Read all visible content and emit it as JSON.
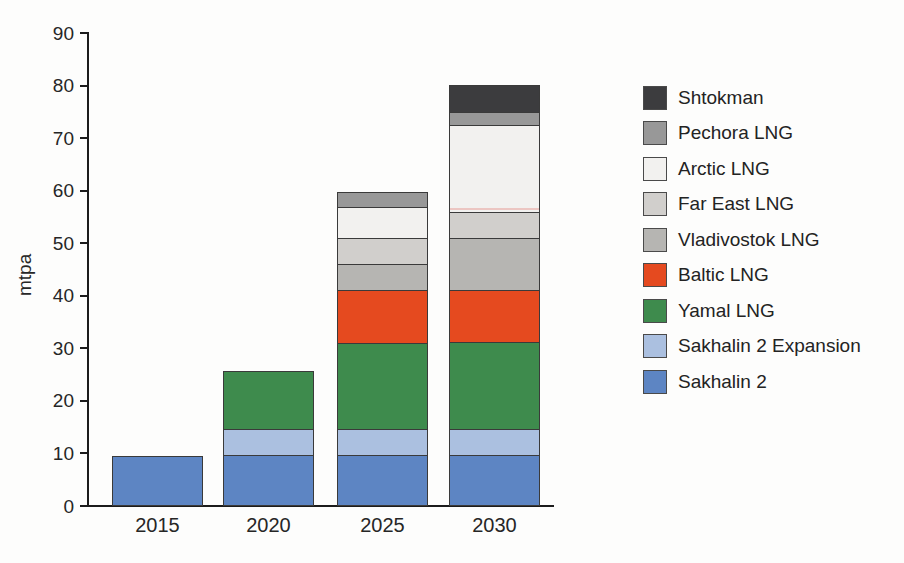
{
  "chart_data": {
    "type": "bar",
    "stacked": true,
    "title": "",
    "xlabel": "",
    "ylabel": "mtpa",
    "ylim": [
      0,
      90
    ],
    "yticks": [
      0,
      10,
      20,
      30,
      40,
      50,
      60,
      70,
      80,
      90
    ],
    "grid": false,
    "legend_position": "right",
    "categories": [
      "2015",
      "2020",
      "2025",
      "2030"
    ],
    "series": [
      {
        "name": "Sakhalin 2",
        "color": "#5d85c3",
        "values": [
          9.6,
          9.6,
          9.6,
          9.6
        ]
      },
      {
        "name": "Sakhalin 2 Expansion",
        "color": "#abc0e0",
        "values": [
          0,
          5,
          5,
          5
        ]
      },
      {
        "name": "Yamal LNG",
        "color": "#3e8b4d",
        "values": [
          0,
          11,
          16.5,
          16.5
        ]
      },
      {
        "name": "Baltic LNG",
        "color": "#e54a1f",
        "values": [
          0,
          0,
          10,
          10
        ]
      },
      {
        "name": "Vladivostok LNG",
        "color": "#b6b5b2",
        "values": [
          0,
          0,
          5,
          10
        ]
      },
      {
        "name": "Far East LNG",
        "color": "#d1cfcc",
        "values": [
          0,
          0,
          5,
          5
        ]
      },
      {
        "name": "Arctic LNG",
        "color": "#f2f1ef",
        "values": [
          0,
          0,
          6,
          16.5
        ]
      },
      {
        "name": "Pechora LNG",
        "color": "#989898",
        "values": [
          0,
          0,
          2.6,
          2.6
        ]
      },
      {
        "name": "Shtokman",
        "color": "#3c3c3e",
        "values": [
          0,
          0,
          0,
          5
        ]
      }
    ],
    "legend_order": [
      "Shtokman",
      "Pechora LNG",
      "Arctic LNG",
      "Far East LNG",
      "Vladivostok LNG",
      "Baltic LNG",
      "Yamal LNG",
      "Sakhalin 2 Expansion",
      "Sakhalin 2"
    ],
    "annotations": {
      "scan_artifact_line": {
        "category": "2030",
        "at_value": 56.1,
        "color": "#ecc6c2"
      }
    },
    "axis_color": "#1c1c1c",
    "segment_border_color": "#3a3a3a",
    "text_color": "#262626"
  }
}
